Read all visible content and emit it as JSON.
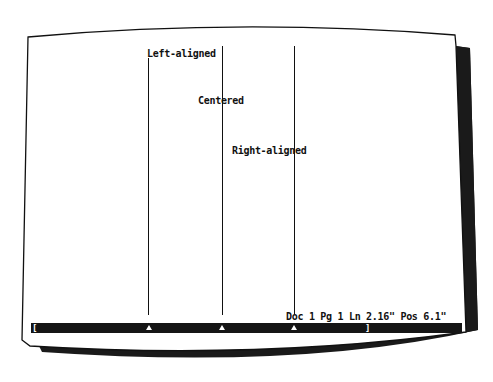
{
  "document": {
    "labels": [
      {
        "text": "Left-aligned",
        "alignment": "left"
      },
      {
        "text": "Centered",
        "alignment": "center"
      },
      {
        "text": "Right-aligned",
        "alignment": "right"
      }
    ]
  },
  "status_bar": {
    "text": "Doc 1 Pg 1 Ln 2.16\" Pos 6.1\""
  },
  "ruler": {
    "left_margin": "[",
    "right_margin": "]",
    "tab_stops": [
      "left-tab",
      "center-tab",
      "right-tab"
    ]
  },
  "colors": {
    "screen": "#ffffff",
    "ink": "#111111",
    "ruler_bg": "#151515",
    "bezel_shadow": "#1a1a1a"
  }
}
